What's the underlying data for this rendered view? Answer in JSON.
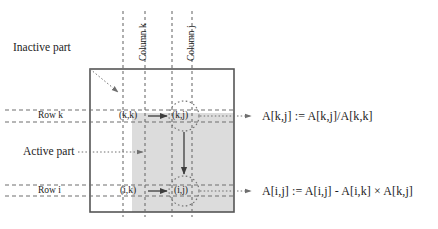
{
  "figure": {
    "colors": {
      "stroke": "#4a4a4a",
      "box_border": "#555555",
      "active_fill": "#dcdcdc",
      "text": "#1d1d1d",
      "dotted": "#7a7a7a",
      "dashed": "#6e6e6e"
    }
  },
  "labels": {
    "inactive_part": "Inactive part",
    "active_part": "Active part",
    "column_k": "Column k",
    "column_j": "Column j",
    "row_k": "Row  k",
    "row_i": "Row  i"
  },
  "cells": {
    "kk": "(k,k)",
    "kj": "(k,j)",
    "ik": "(i,k)",
    "ij": "(i,j)"
  },
  "equations": {
    "top": "A[k,j] := A[k,j]/A[k,k]",
    "bottom": "A[i,j] := A[i,j] - A[i,k] ×  A[k,j]"
  },
  "geometry": {
    "box": {
      "x": 90,
      "y": 69,
      "w": 144,
      "h": 143
    },
    "active_region": {
      "x": 132,
      "y": 113,
      "w": 102,
      "h": 99
    },
    "column_k_lines": [
      123,
      145
    ],
    "column_j_lines": [
      172,
      192
    ],
    "row_k_lines": [
      110,
      122
    ],
    "row_i_lines": [
      185,
      196
    ],
    "cell_kj_center": {
      "x": 184,
      "y": 116
    },
    "cell_ij_center": {
      "x": 184,
      "y": 191
    },
    "circle_radius": 15
  }
}
